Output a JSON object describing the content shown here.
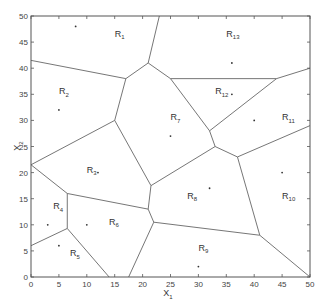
{
  "chart_data": {
    "type": "voronoi",
    "title": "",
    "xlabel": "X1",
    "ylabel": "X2",
    "xlim": [
      0,
      50
    ],
    "ylim": [
      0,
      50
    ],
    "xticks": [
      0,
      5,
      10,
      15,
      20,
      25,
      30,
      35,
      40,
      45,
      50
    ],
    "yticks": [
      0,
      5,
      10,
      15,
      20,
      25,
      30,
      35,
      40,
      45,
      50
    ],
    "grid": false,
    "sites": [
      {
        "region": "R1",
        "x": 8,
        "y": 48
      },
      {
        "region": "R2",
        "x": 5,
        "y": 32
      },
      {
        "region": "R3",
        "x": 12,
        "y": 20
      },
      {
        "region": "R4",
        "x": 3,
        "y": 10
      },
      {
        "region": "R5",
        "x": 5,
        "y": 6
      },
      {
        "region": "R6",
        "x": 10,
        "y": 10
      },
      {
        "region": "R7",
        "x": 25,
        "y": 27
      },
      {
        "region": "R8",
        "x": 32,
        "y": 17
      },
      {
        "region": "R9",
        "x": 30,
        "y": 2
      },
      {
        "region": "R10",
        "x": 45,
        "y": 20
      },
      {
        "region": "R11",
        "x": 40,
        "y": 30
      },
      {
        "region": "R12",
        "x": 36,
        "y": 35
      },
      {
        "region": "R13",
        "x": 36,
        "y": 41
      }
    ],
    "labels": [
      {
        "text": "R",
        "sub": "1",
        "x": 15,
        "y": 46
      },
      {
        "text": "R",
        "sub": "2",
        "x": 5,
        "y": 35
      },
      {
        "text": "R",
        "sub": "3",
        "x": 10,
        "y": 20
      },
      {
        "text": "R",
        "sub": "4",
        "x": 4,
        "y": 13
      },
      {
        "text": "R",
        "sub": "5",
        "x": 7,
        "y": 4
      },
      {
        "text": "R",
        "sub": "6",
        "x": 14,
        "y": 10
      },
      {
        "text": "R",
        "sub": "7",
        "x": 25,
        "y": 30
      },
      {
        "text": "R",
        "sub": "8",
        "x": 28,
        "y": 15
      },
      {
        "text": "R",
        "sub": "9",
        "x": 30,
        "y": 5
      },
      {
        "text": "R",
        "sub": "10",
        "x": 45,
        "y": 15
      },
      {
        "text": "R",
        "sub": "11",
        "x": 45,
        "y": 30
      },
      {
        "text": "R",
        "sub": "12",
        "x": 33,
        "y": 35
      },
      {
        "text": "R",
        "sub": "13",
        "x": 35,
        "y": 46
      }
    ],
    "edges": [
      [
        [
          23,
          50
        ],
        [
          21,
          41
        ]
      ],
      [
        [
          21,
          41
        ],
        [
          17,
          38
        ]
      ],
      [
        [
          21,
          41
        ],
        [
          25,
          38
        ]
      ],
      [
        [
          0,
          41.5
        ],
        [
          17,
          38
        ]
      ],
      [
        [
          17,
          38
        ],
        [
          15,
          30
        ]
      ],
      [
        [
          25,
          38
        ],
        [
          44,
          38
        ]
      ],
      [
        [
          44,
          38
        ],
        [
          50,
          40
        ]
      ],
      [
        [
          25,
          38
        ],
        [
          32,
          28
        ]
      ],
      [
        [
          44,
          38
        ],
        [
          32,
          28
        ]
      ],
      [
        [
          32,
          28
        ],
        [
          33,
          25
        ]
      ],
      [
        [
          33,
          25
        ],
        [
          37,
          23
        ]
      ],
      [
        [
          37,
          23
        ],
        [
          50,
          29
        ]
      ],
      [
        [
          37,
          23
        ],
        [
          41,
          8
        ]
      ],
      [
        [
          41,
          8
        ],
        [
          50,
          0
        ]
      ],
      [
        [
          33,
          25
        ],
        [
          21.5,
          17.5
        ]
      ],
      [
        [
          15,
          30
        ],
        [
          21.5,
          17.5
        ]
      ],
      [
        [
          15,
          30
        ],
        [
          0,
          21.5
        ]
      ],
      [
        [
          0,
          21.5
        ],
        [
          6.5,
          16
        ]
      ],
      [
        [
          6.5,
          16
        ],
        [
          21,
          13
        ]
      ],
      [
        [
          21.5,
          17.5
        ],
        [
          21,
          13
        ]
      ],
      [
        [
          21,
          13
        ],
        [
          22,
          10.5
        ]
      ],
      [
        [
          22,
          10.5
        ],
        [
          41,
          8
        ]
      ],
      [
        [
          22,
          10.5
        ],
        [
          17.5,
          0
        ]
      ],
      [
        [
          6.5,
          16
        ],
        [
          6.5,
          9.3
        ]
      ],
      [
        [
          6.5,
          9.3
        ],
        [
          0,
          6
        ]
      ],
      [
        [
          6.5,
          9.3
        ],
        [
          14,
          0
        ]
      ]
    ]
  },
  "axes": {
    "xlabel_main": "X",
    "xlabel_sub": "1",
    "ylabel_main": "X",
    "ylabel_sub": "2"
  }
}
